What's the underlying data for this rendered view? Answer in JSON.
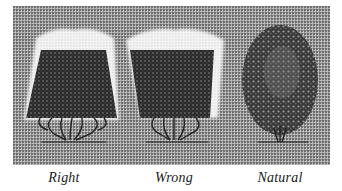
{
  "figure": {
    "panel_color": "#9a9a9a",
    "foliage_color": "#2e2e2e",
    "halo_color": "#ffffff",
    "shrubs": [
      {
        "id": "right",
        "label": "Right",
        "shape": "trapezoid-wide-base"
      },
      {
        "id": "wrong",
        "label": "Wrong",
        "shape": "trapezoid-wide-top"
      },
      {
        "id": "natural",
        "label": "Natural",
        "shape": "oval"
      }
    ]
  }
}
